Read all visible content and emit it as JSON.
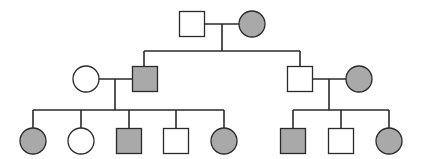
{
  "diagram": {
    "type": "pedigree",
    "colors": {
      "affected_fill": "#a9a9a9",
      "unaffected_fill": "#ffffff",
      "stroke": "#2a2a2a"
    },
    "shape_size": 25,
    "individuals": [
      {
        "id": "I-1",
        "generation": 1,
        "sex": "male",
        "affected": false,
        "cx": 192,
        "cy": 24
      },
      {
        "id": "I-2",
        "generation": 1,
        "sex": "female",
        "affected": true,
        "cx": 252,
        "cy": 24
      },
      {
        "id": "II-1",
        "generation": 2,
        "sex": "female",
        "affected": false,
        "cx": 86,
        "cy": 79
      },
      {
        "id": "II-2",
        "generation": 2,
        "sex": "male",
        "affected": true,
        "cx": 145,
        "cy": 79
      },
      {
        "id": "II-3",
        "generation": 2,
        "sex": "male",
        "affected": false,
        "cx": 300,
        "cy": 79
      },
      {
        "id": "II-4",
        "generation": 2,
        "sex": "female",
        "affected": true,
        "cx": 359,
        "cy": 79
      },
      {
        "id": "III-1",
        "generation": 3,
        "sex": "female",
        "affected": true,
        "cx": 33,
        "cy": 141
      },
      {
        "id": "III-2",
        "generation": 3,
        "sex": "female",
        "affected": false,
        "cx": 81,
        "cy": 141
      },
      {
        "id": "III-3",
        "generation": 3,
        "sex": "male",
        "affected": true,
        "cx": 129,
        "cy": 141
      },
      {
        "id": "III-4",
        "generation": 3,
        "sex": "male",
        "affected": false,
        "cx": 176,
        "cy": 141
      },
      {
        "id": "III-5",
        "generation": 3,
        "sex": "female",
        "affected": true,
        "cx": 224,
        "cy": 141
      },
      {
        "id": "III-6",
        "generation": 3,
        "sex": "male",
        "affected": true,
        "cx": 293,
        "cy": 141
      },
      {
        "id": "III-7",
        "generation": 3,
        "sex": "male",
        "affected": false,
        "cx": 341,
        "cy": 141
      },
      {
        "id": "III-8",
        "generation": 3,
        "sex": "female",
        "affected": true,
        "cx": 389,
        "cy": 141
      }
    ],
    "lines": [
      {
        "name": "mating-line-gen1",
        "x1": 204,
        "y1": 24,
        "x2": 239,
        "y2": 24
      },
      {
        "name": "descent-line-gen1",
        "x1": 222,
        "y1": 24,
        "x2": 222,
        "y2": 51
      },
      {
        "name": "sibship-line-gen2",
        "x1": 144,
        "y1": 51,
        "x2": 300,
        "y2": 51
      },
      {
        "name": "drop-line-II-2",
        "x1": 144,
        "y1": 51,
        "x2": 144,
        "y2": 67
      },
      {
        "name": "drop-line-II-3",
        "x1": 300,
        "y1": 51,
        "x2": 300,
        "y2": 67
      },
      {
        "name": "mating-line-left",
        "x1": 99,
        "y1": 79,
        "x2": 133,
        "y2": 79
      },
      {
        "name": "descent-line-left",
        "x1": 115,
        "y1": 79,
        "x2": 115,
        "y2": 110
      },
      {
        "name": "sibship-line-left",
        "x1": 33,
        "y1": 110,
        "x2": 224,
        "y2": 110
      },
      {
        "name": "drop-line-III-1",
        "x1": 33,
        "y1": 110,
        "x2": 33,
        "y2": 128
      },
      {
        "name": "drop-line-III-2",
        "x1": 81,
        "y1": 110,
        "x2": 81,
        "y2": 128
      },
      {
        "name": "drop-line-III-3",
        "x1": 129,
        "y1": 110,
        "x2": 129,
        "y2": 128
      },
      {
        "name": "drop-line-III-4",
        "x1": 176,
        "y1": 110,
        "x2": 176,
        "y2": 128
      },
      {
        "name": "drop-line-III-5",
        "x1": 224,
        "y1": 110,
        "x2": 224,
        "y2": 128
      },
      {
        "name": "mating-line-right",
        "x1": 312,
        "y1": 79,
        "x2": 346,
        "y2": 79
      },
      {
        "name": "descent-line-right",
        "x1": 329,
        "y1": 79,
        "x2": 329,
        "y2": 110
      },
      {
        "name": "sibship-line-right",
        "x1": 293,
        "y1": 110,
        "x2": 389,
        "y2": 110
      },
      {
        "name": "drop-line-III-6",
        "x1": 293,
        "y1": 110,
        "x2": 293,
        "y2": 128
      },
      {
        "name": "drop-line-III-7",
        "x1": 341,
        "y1": 110,
        "x2": 341,
        "y2": 128
      },
      {
        "name": "drop-line-III-8",
        "x1": 389,
        "y1": 110,
        "x2": 389,
        "y2": 128
      }
    ]
  }
}
